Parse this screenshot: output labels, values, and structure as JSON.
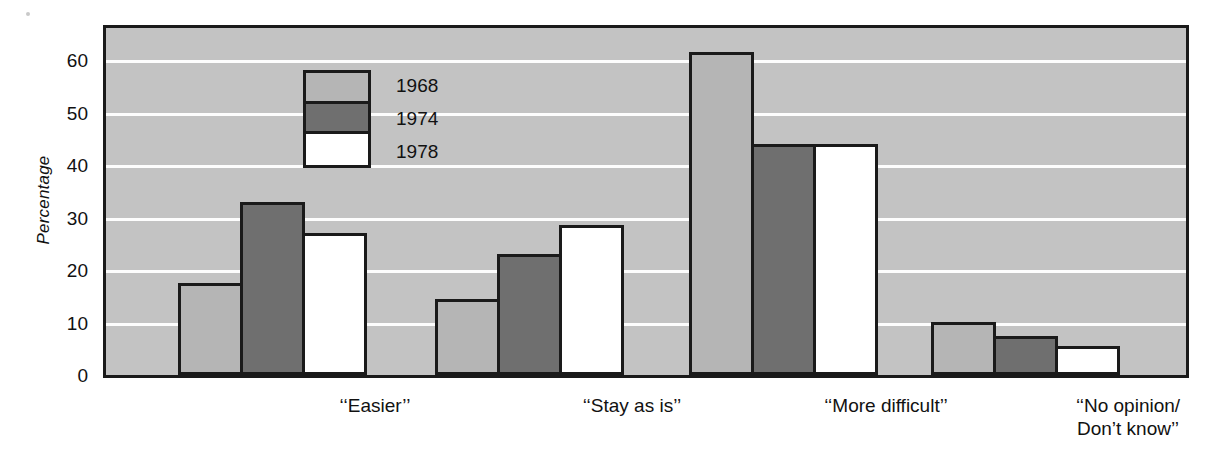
{
  "chart_data": {
    "type": "bar",
    "title": "",
    "xlabel": "",
    "ylabel": "Percentage",
    "ylim": [
      0,
      65
    ],
    "yticks": [
      0,
      10,
      20,
      30,
      40,
      50,
      60
    ],
    "grid": "horizontal white gridlines at every 10 percent",
    "legend_position": "inside upper-left of plot area",
    "categories": [
      "‘‘Easier’’",
      "‘‘Stay as is’’",
      "‘‘More  difficult’’",
      "‘‘No opinion/\nDon’t know’’"
    ],
    "series": [
      {
        "name": "1968",
        "color": "#b5b5b5",
        "values": [
          17.5,
          14.5,
          61.5,
          10.0
        ]
      },
      {
        "name": "1974",
        "color": "#6f6f6f",
        "values": [
          33.0,
          23.0,
          44.0,
          7.5
        ]
      },
      {
        "name": "1978",
        "color": "#ffffff",
        "values": [
          27.0,
          28.5,
          44.0,
          5.5
        ]
      }
    ]
  },
  "legend": {
    "entries": [
      {
        "label": "1968"
      },
      {
        "label": "1974"
      },
      {
        "label": "1978"
      }
    ]
  },
  "axis": {
    "y_title": "Percentage",
    "y_ticks": [
      "60",
      "50",
      "40",
      "30",
      "20",
      "10",
      "0"
    ]
  },
  "colors": {
    "plot_background": "#c3c3c3",
    "gridline": "#fdfdfd",
    "frame": "#1a1a1a",
    "series_1968": "#b5b5b5",
    "series_1974": "#6f6f6f",
    "series_1978": "#ffffff",
    "text": "#111111"
  }
}
